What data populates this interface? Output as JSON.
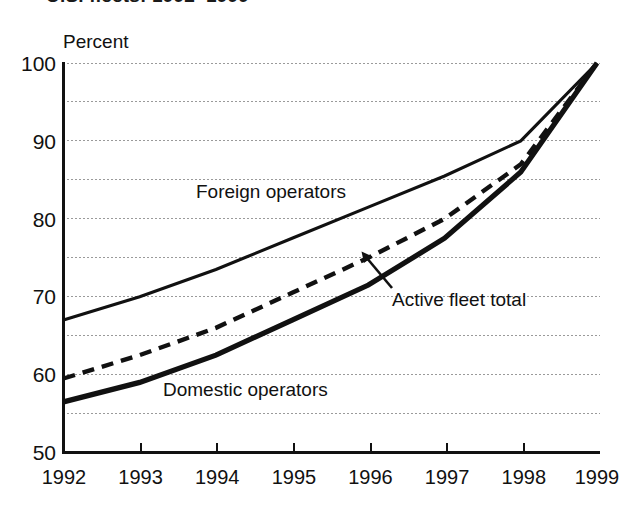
{
  "figure": {
    "title_clipped": "U.S. fleets: 1992–1999",
    "axis_unit_label": "Percent"
  },
  "labels": {
    "foreign": "Foreign operators",
    "total": "Active fleet total",
    "domestic": "Domestic operators"
  },
  "annotation": {
    "leader_target_series": "Active fleet total",
    "leader_target_year": "1996"
  },
  "chart_data": {
    "type": "line",
    "title": "U.S. fleets: 1992–1999",
    "xlabel": "",
    "ylabel": "Percent",
    "ylim": [
      50,
      100
    ],
    "xlim": [
      "1992",
      "1999"
    ],
    "grid": true,
    "grid_axis": "y",
    "legend": "inline-labels",
    "y_major_ticks": [
      50,
      60,
      70,
      80,
      90,
      100
    ],
    "y_minor_gridlines": [
      55,
      65,
      75,
      85,
      95
    ],
    "y_tick_labels": [
      "50",
      "60",
      "70",
      "80",
      "90",
      "100"
    ],
    "categories": [
      "1992",
      "1993",
      "1994",
      "1995",
      "1996",
      "1997",
      "1998",
      "1999"
    ],
    "x_tick_labels": [
      "1992",
      "1993",
      "1994",
      "1995",
      "1996",
      "1997",
      "1998",
      "1999"
    ],
    "series": [
      {
        "name": "Foreign operators",
        "style": "solid-thin",
        "values": [
          67.0,
          70.0,
          73.5,
          77.5,
          81.5,
          85.5,
          90.0,
          100.0
        ]
      },
      {
        "name": "Active fleet total",
        "style": "dashed",
        "values": [
          59.5,
          62.5,
          66.0,
          70.5,
          75.0,
          80.0,
          87.0,
          100.0
        ]
      },
      {
        "name": "Domestic operators",
        "style": "solid-thick",
        "values": [
          56.5,
          59.0,
          62.5,
          67.0,
          71.5,
          77.5,
          86.0,
          100.0
        ]
      }
    ],
    "annotations": [
      {
        "text": "Active fleet total",
        "points_to": {
          "series": "Active fleet total",
          "x": "1996",
          "y": 75.0
        }
      },
      {
        "text": "Foreign operators",
        "points_to": null
      },
      {
        "text": "Domestic operators",
        "points_to": null
      }
    ]
  },
  "colors": {
    "ink": "#111111",
    "grid": "#9a9a9a",
    "background": "#ffffff"
  }
}
